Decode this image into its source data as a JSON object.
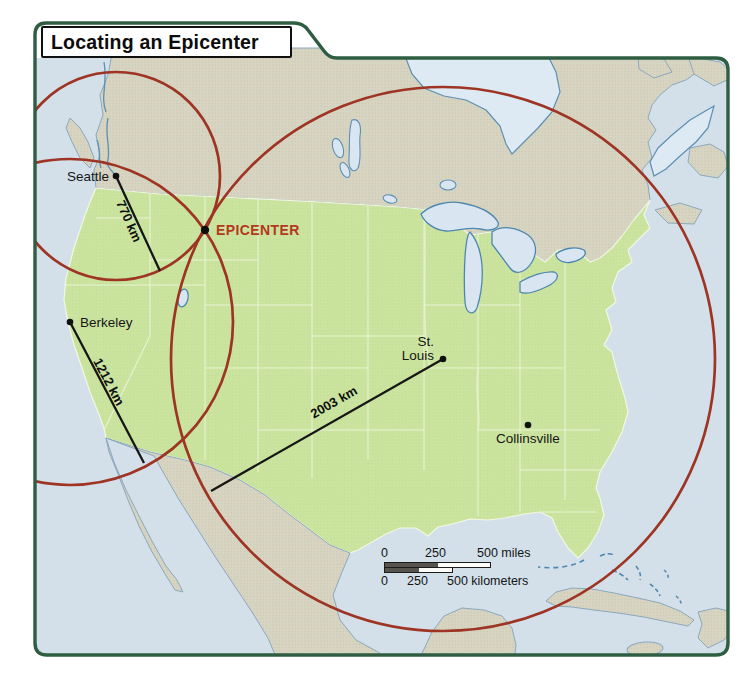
{
  "figure": {
    "title": "Locating an Epicenter"
  },
  "map": {
    "epicenter": {
      "label": "EPICENTER",
      "x": 205,
      "y": 230,
      "label_x": 216,
      "label_y": 235
    },
    "stations": [
      {
        "name": "Seattle",
        "distance_km": 770,
        "distance_label": "770 km",
        "x": 116,
        "y": 176,
        "radius_px": 104,
        "line_end": {
          "x": 160,
          "y": 271
        },
        "name_x": 109,
        "name_y": 181,
        "name_anchor": "end",
        "dist_label_x": 125,
        "dist_label_y": 223,
        "dist_label_angle": 66
      },
      {
        "name": "Berkeley",
        "distance_km": 1212,
        "distance_label": "1212 km",
        "x": 70,
        "y": 322,
        "radius_px": 163,
        "line_end": {
          "x": 144,
          "y": 463
        },
        "name_x": 80,
        "name_y": 327,
        "name_anchor": "start",
        "dist_label_x": 105,
        "dist_label_y": 384,
        "dist_label_angle": 62
      },
      {
        "name": "St. Louis",
        "name_lines": [
          "St.",
          "Louis"
        ],
        "distance_km": 2003,
        "distance_label": "2003 km",
        "x": 443,
        "y": 359,
        "radius_px": 272,
        "line_end": {
          "x": 211,
          "y": 491
        },
        "name_x": 434,
        "name_y": 346,
        "name_anchor": "end",
        "dist_label_x": 336,
        "dist_label_y": 406,
        "dist_label_angle": -29.5
      }
    ],
    "cities": [
      {
        "name": "Collinsville",
        "x": 528,
        "y": 425,
        "label_x": 528,
        "label_y": 443
      }
    ],
    "scale_bar": {
      "miles_0": "0",
      "miles_250": "250",
      "miles_end": "500 miles",
      "km_0": "0",
      "km_250": "250",
      "km_end": "500 kilometers"
    },
    "colors": {
      "circle_red": "#9e3424",
      "epicenter_red": "#b5371c",
      "us_green": "#cbe49f",
      "land_tan": "#d7d4c2",
      "ocean_blue": "#d3e0ea",
      "lake_blue": "#d9e6f1",
      "coast_blue": "#5d8fb2",
      "frame_green": "#2e5d41"
    }
  }
}
